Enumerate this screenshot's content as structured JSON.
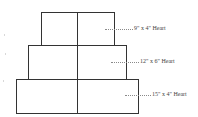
{
  "diagram": {
    "type": "tiered-cake-layout",
    "tiers": [
      {
        "label": "9\" x 4\" Heart",
        "box": {
          "x": 41,
          "y": 12,
          "w": 74,
          "h": 34
        },
        "leader": {
          "x": 105,
          "y": 29,
          "w": 28
        },
        "label_pos": {
          "x": 134,
          "y": 25
        }
      },
      {
        "label": "12\" x 6\" Heart",
        "box": {
          "x": 28,
          "y": 45,
          "w": 99,
          "h": 35
        },
        "leader": {
          "x": 111,
          "y": 62,
          "w": 28
        },
        "label_pos": {
          "x": 140,
          "y": 58
        }
      },
      {
        "label": "15\" x 4\" Heart",
        "box": {
          "x": 16,
          "y": 79,
          "w": 123,
          "h": 35
        },
        "leader": {
          "x": 125,
          "y": 95,
          "w": 26
        },
        "label_pos": {
          "x": 152,
          "y": 91
        }
      }
    ],
    "center_divider_x": 77,
    "colors": {
      "stroke": "#333333",
      "leader": "#8a8a8a",
      "text": "#444444"
    }
  }
}
